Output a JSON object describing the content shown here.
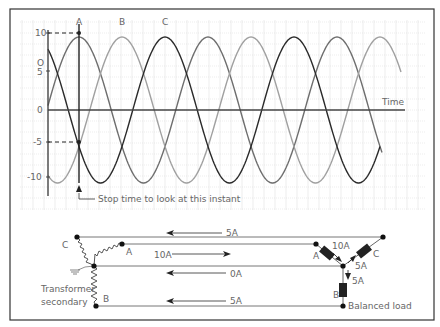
{
  "colors": {
    "frame": "#333333",
    "grid": "#d8d8d8",
    "axis": "#444444",
    "phase_a": "#6e6e6e",
    "phase_b": "#a0a0a0",
    "phase_c": "#2a2a2a",
    "text": "#666666",
    "wire": "#777777",
    "node": "#111111"
  },
  "chart_data": {
    "type": "line",
    "title": "",
    "xlabel": "Time",
    "ylabel": "",
    "y_ticks": [
      "10",
      "5",
      "0",
      "-5",
      "-10"
    ],
    "y_tick_values": [
      10,
      5,
      0,
      -5,
      -10
    ],
    "ylim": [
      -13,
      11
    ],
    "grid": true,
    "series": [
      {
        "name": "A",
        "amplitude": 10,
        "phase_deg": 0,
        "peak_label_x": "A"
      },
      {
        "name": "B",
        "amplitude": 10,
        "phase_deg": -120,
        "peak_label_x": "B"
      },
      {
        "name": "C",
        "amplitude": 10,
        "phase_deg": -240,
        "peak_label_x": "C"
      }
    ],
    "cycles_shown": 2.7,
    "annotations": [
      {
        "text": "Stop time to look at this instant",
        "at": "A peak",
        "values_at_instant": {
          "A": 10,
          "B": -5,
          "C": -5
        }
      },
      {
        "text": "dashed guide",
        "y": 10
      },
      {
        "text": "dashed guide",
        "y": -5
      }
    ]
  },
  "waveform": {
    "phase_labels": [
      "A",
      "B",
      "C"
    ],
    "y_labels": [
      "10",
      "5",
      "0",
      "-5",
      "-10"
    ],
    "time_label": "Time",
    "annotation": "Stop time to look at this instant"
  },
  "circuit": {
    "source_label": "Transformer secondary",
    "source_label_line1": "Transformer",
    "source_label_line2": "secondary",
    "load_label": "Balanced load",
    "source_terminals": [
      "A",
      "B",
      "C"
    ],
    "load_terminals": [
      "A",
      "B",
      "C"
    ],
    "line_currents": [
      {
        "line": "C",
        "value": "5A",
        "direction": "left"
      },
      {
        "line": "A",
        "value": "10A",
        "direction": "right"
      },
      {
        "line": "N",
        "value": "0A",
        "direction": "left"
      },
      {
        "line": "B",
        "value": "5A",
        "direction": "left"
      }
    ],
    "load_currents": [
      {
        "branch": "A",
        "value": "10A",
        "direction": "in"
      },
      {
        "branch": "C",
        "value": "5A",
        "direction": "out"
      },
      {
        "branch": "B",
        "value": "5A",
        "direction": "out"
      }
    ]
  }
}
